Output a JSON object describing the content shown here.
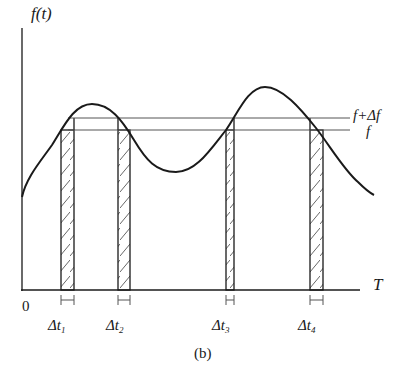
{
  "figure": {
    "caption": "(b)",
    "y_axis_label": "f(t)",
    "x_axis_label": "T",
    "origin_label": "0"
  },
  "levels": {
    "upper": {
      "label": "f+Δf",
      "y_px": 118
    },
    "lower": {
      "label": "f",
      "y_px": 130
    }
  },
  "intervals": [
    {
      "label_main": "Δt",
      "label_sub": "1",
      "x_start": 61,
      "x_end": 74
    },
    {
      "label_main": "Δt",
      "label_sub": "2",
      "x_start": 118,
      "x_end": 130
    },
    {
      "label_main": "Δt",
      "label_sub": "3",
      "x_start": 226,
      "x_end": 234
    },
    {
      "label_main": "Δt",
      "label_sub": "4",
      "x_start": 310,
      "x_end": 323
    }
  ],
  "colors": {
    "ink": "#1a1a1a",
    "thin_line": "#555555",
    "background": "#ffffff"
  }
}
